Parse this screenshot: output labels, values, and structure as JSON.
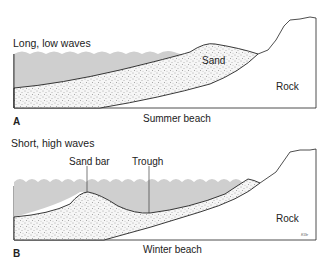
{
  "panels": [
    {
      "letter": "A",
      "caption": "Summer beach",
      "wave_label": "Long, low waves",
      "labels": {
        "sand": "Sand",
        "rock": "Rock"
      }
    },
    {
      "letter": "B",
      "caption": "Winter beach",
      "wave_label": "Short, high waves",
      "labels": {
        "sand_bar": "Sand bar",
        "trough": "Trough",
        "rock": "Rock"
      },
      "signature": "KGr"
    }
  ],
  "colors": {
    "water": "#cfcfcf",
    "sand": "#f4f4f4",
    "line": "#222222",
    "rock": "#ffffff"
  }
}
